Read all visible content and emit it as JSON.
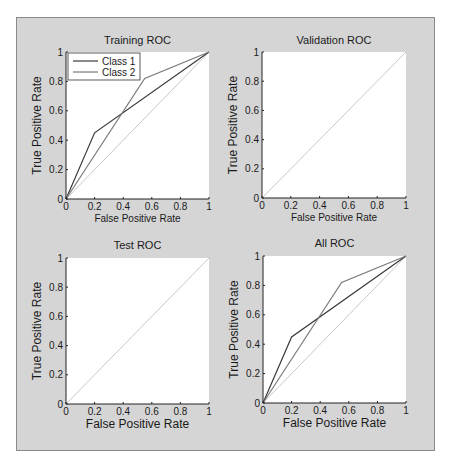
{
  "figure": {
    "background": "#d5d5d5",
    "plot_background": "#ffffff"
  },
  "chart_data": [
    {
      "type": "line",
      "title": "Training ROC",
      "xlabel": "False Positive Rate",
      "ylabel": "True Positive Rate",
      "xlim": [
        0,
        1
      ],
      "ylim": [
        0,
        1
      ],
      "xticks": [
        "0",
        "0.2",
        "0.4",
        "0.6",
        "0.8",
        "1"
      ],
      "yticks": [
        "0",
        "0.2",
        "0.4",
        "0.6",
        "0.8",
        "1"
      ],
      "grid": false,
      "legend": {
        "position": "top-left",
        "entries": [
          "Class 1",
          "Class 2"
        ]
      },
      "series": [
        {
          "name": "Class 1",
          "color": "#3a3a3a",
          "x": [
            0,
            0.2,
            1
          ],
          "y": [
            0,
            0.45,
            1
          ]
        },
        {
          "name": "Class 2",
          "color": "#7a7a7a",
          "x": [
            0,
            0.55,
            1
          ],
          "y": [
            0,
            0.82,
            1
          ]
        },
        {
          "name": "Chance",
          "color": "#c8c8c8",
          "x": [
            0,
            1
          ],
          "y": [
            0,
            1
          ]
        }
      ]
    },
    {
      "type": "line",
      "title": "Validation ROC",
      "xlabel": "False Positive Rate",
      "ylabel": "True Positive Rate",
      "xlim": [
        0,
        1
      ],
      "ylim": [
        0,
        1
      ],
      "xticks": [
        "0",
        "0.2",
        "0.4",
        "0.6",
        "0.8",
        "1"
      ],
      "yticks": [
        "0",
        "0.2",
        "0.4",
        "0.6",
        "0.8",
        "1"
      ],
      "grid": false,
      "series": [
        {
          "name": "Chance",
          "color": "#c8c8c8",
          "x": [
            0,
            1
          ],
          "y": [
            0,
            1
          ]
        }
      ]
    },
    {
      "type": "line",
      "title": "Test ROC",
      "xlabel": "False Positive Rate",
      "ylabel": "True Positive Rate",
      "xlim": [
        0,
        1
      ],
      "ylim": [
        0,
        1
      ],
      "xticks": [
        "0",
        "0.2",
        "0.4",
        "0.6",
        "0.8",
        "1"
      ],
      "yticks": [
        "0",
        "0.2",
        "0.4",
        "0.6",
        "0.8",
        "1"
      ],
      "grid": false,
      "series": [
        {
          "name": "Chance",
          "color": "#c8c8c8",
          "x": [
            0,
            1
          ],
          "y": [
            0,
            1
          ]
        }
      ]
    },
    {
      "type": "line",
      "title": "All ROC",
      "xlabel": "False Positive Rate",
      "ylabel": "True Positive Rate",
      "xlim": [
        0,
        1
      ],
      "ylim": [
        0,
        1
      ],
      "xticks": [
        "0",
        "0.2",
        "0.4",
        "0.6",
        "0.8",
        "1"
      ],
      "yticks": [
        "0",
        "0.2",
        "0.4",
        "0.6",
        "0.8",
        "1"
      ],
      "grid": false,
      "series": [
        {
          "name": "Class 1",
          "color": "#3a3a3a",
          "x": [
            0,
            0.2,
            1
          ],
          "y": [
            0,
            0.45,
            1
          ]
        },
        {
          "name": "Class 2",
          "color": "#7a7a7a",
          "x": [
            0,
            0.55,
            1
          ],
          "y": [
            0,
            0.82,
            1
          ]
        },
        {
          "name": "Chance",
          "color": "#c8c8c8",
          "x": [
            0,
            1
          ],
          "y": [
            0,
            1
          ]
        }
      ]
    }
  ]
}
